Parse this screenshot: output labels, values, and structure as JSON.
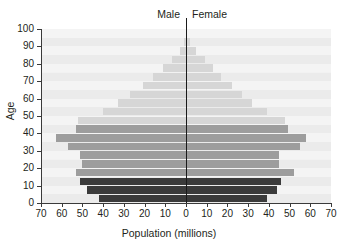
{
  "chart_data": {
    "type": "bar",
    "subtype": "population-pyramid",
    "title": "",
    "xlabel": "Population (millions)",
    "ylabel": "Age",
    "x_tick_labels": [
      "70",
      "60",
      "50",
      "40",
      "30",
      "20",
      "10",
      "0",
      "10",
      "20",
      "30",
      "40",
      "50",
      "60",
      "70"
    ],
    "x_tick_values": [
      -70,
      -60,
      -50,
      -40,
      -30,
      -20,
      -10,
      0,
      10,
      20,
      30,
      40,
      50,
      60,
      70
    ],
    "xlim": [
      -70,
      70
    ],
    "y_tick_labels": [
      "0",
      "10",
      "20",
      "30",
      "40",
      "50",
      "60",
      "70",
      "80",
      "90",
      "100"
    ],
    "y_tick_values": [
      0,
      10,
      20,
      30,
      40,
      50,
      60,
      70,
      80,
      90,
      100
    ],
    "ylim": [
      0,
      100
    ],
    "grid": false,
    "legend_position": "top-center",
    "categories": [
      "0-4",
      "5-9",
      "10-14",
      "15-19",
      "20-24",
      "25-29",
      "30-34",
      "35-39",
      "40-44",
      "45-49",
      "50-54",
      "55-59",
      "60-64",
      "65-69",
      "70-74",
      "75-79",
      "80-84",
      "85-89",
      "90+"
    ],
    "series": [
      {
        "name": "Male",
        "side": "left",
        "color": "#3b3b3b",
        "values": [
          42,
          48,
          51,
          53,
          50,
          51,
          57,
          63,
          53,
          52,
          40,
          33,
          27,
          21,
          16,
          11,
          7,
          3,
          1
        ]
      },
      {
        "name": "Female",
        "side": "right",
        "color": "#3b3b3b",
        "values": [
          39,
          44,
          46,
          52,
          45,
          45,
          55,
          58,
          49,
          48,
          39,
          32,
          27,
          22,
          17,
          13,
          9,
          5,
          2
        ]
      }
    ],
    "color_bands": [
      {
        "name": "children",
        "age_from": 0,
        "age_to": 15,
        "color": "#3b3b3b"
      },
      {
        "name": "working-age",
        "age_from": 15,
        "age_to": 45,
        "color": "#9d9d9d"
      },
      {
        "name": "older-adults",
        "age_from": 45,
        "age_to": 95,
        "color": "#d6d6d6"
      }
    ],
    "plot_background": "#f2f2f2",
    "band_stripe_color": "#ebebeb",
    "axis_color": "#1a1a1a"
  },
  "labels": {
    "male": "Male",
    "female": "Female",
    "x_title": "Population (millions)",
    "y_title": "Age"
  }
}
